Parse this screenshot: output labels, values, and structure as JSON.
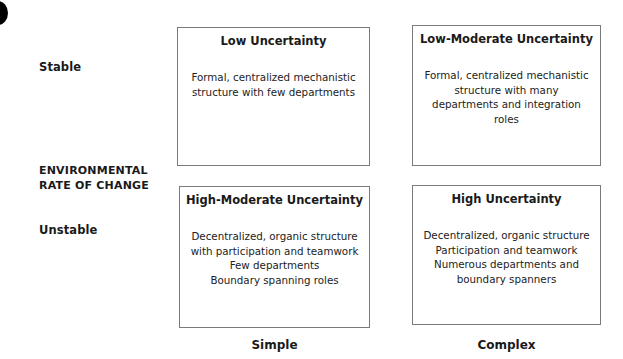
{
  "diagram": {
    "axis_title_lines": [
      "ENVIRONMENTAL",
      "RATE OF CHANGE"
    ],
    "row_labels": {
      "top": "Stable",
      "bottom": "Unstable"
    },
    "column_labels": {
      "left": "Simple",
      "right": "Complex"
    },
    "cells": {
      "top_left": {
        "title": "Low Uncertainty",
        "lines": [
          "Formal, centralized mechanistic",
          "structure with few departments"
        ]
      },
      "top_right": {
        "title": "Low-Moderate Uncertainty",
        "lines": [
          "Formal, centralized mechanistic",
          "structure with many",
          "departments and integration",
          "roles"
        ]
      },
      "bottom_left": {
        "title": "High-Moderate Uncertainty",
        "lines": [
          "Decentralized, organic structure",
          "with participation and teamwork",
          "Few departments",
          "Boundary spanning roles"
        ]
      },
      "bottom_right": {
        "title": "High Uncertainty",
        "lines": [
          "Decentralized, organic structure",
          "Participation and teamwork",
          "Numerous departments and",
          "boundary spanners"
        ]
      }
    }
  },
  "colors": {
    "border": "#7a7a7a",
    "text": "#1a1a1a",
    "background": "#ffffff"
  }
}
